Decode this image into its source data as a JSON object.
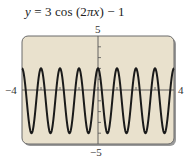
{
  "title": {
    "y_var": "y",
    "eq": " = 3 cos (2",
    "pi": "π",
    "x_var": "x",
    "tail": ") − 1"
  },
  "labels": {
    "x_min": "−4",
    "x_max": "4",
    "y_max": "5",
    "y_min": "−5"
  },
  "colors": {
    "background": "#ffffff",
    "screen_fill": "#e9e1cd",
    "frame_border": "#6b6b6b",
    "frame_shadow": "#9a9a9a",
    "axis": "#555555",
    "curve": "#1a1a1a"
  },
  "chart_data": {
    "type": "line",
    "title": "y = 3 cos (2πx) − 1",
    "function": "3*cos(2*pi*x) - 1",
    "xlabel": "",
    "ylabel": "",
    "xlim": [
      -4,
      4
    ],
    "ylim": [
      -5,
      5
    ],
    "x_tick_step": 1,
    "y_tick_step": 1,
    "grid": false,
    "legend": null,
    "tick_labels": {
      "x": [
        "−4",
        "4"
      ],
      "y": [
        "−5",
        "5"
      ]
    },
    "series": [
      {
        "name": "y = 3 cos (2πx) − 1",
        "x": [
          -4,
          -3.5,
          -3,
          -2.5,
          -2,
          -1.5,
          -1,
          -0.5,
          0,
          0.5,
          1,
          1.5,
          2,
          2.5,
          3,
          3.5,
          4
        ],
        "values": [
          2,
          -4,
          2,
          -4,
          2,
          -4,
          2,
          -4,
          2,
          -4,
          2,
          -4,
          2,
          -4,
          2,
          -4,
          2
        ]
      }
    ],
    "annotations": [
      "max = 2 at integer x",
      "min = −4 at half-integer x",
      "period = 1"
    ]
  }
}
